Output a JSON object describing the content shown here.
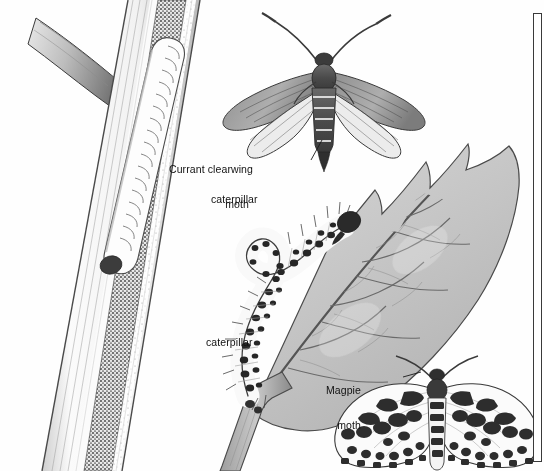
{
  "plate": {
    "title": "Currant pests illustration plate",
    "background_color": "#fefefe",
    "ink_color": "#2b2b2b",
    "frame_color": "#3a3a3a",
    "width": 544,
    "height": 471
  },
  "labels": [
    {
      "id": "currant-clearwing-moth",
      "line1": "Currant clearwing",
      "line2": "moth",
      "x": 249,
      "y": 142,
      "align": "right"
    },
    {
      "id": "caterpillar-top",
      "text": "caterpillar",
      "x": 211,
      "y": 194
    },
    {
      "id": "caterpillar-bottom",
      "text": "caterpillar",
      "x": 206,
      "y": 337
    },
    {
      "id": "magpie-moth",
      "line1": "Magpie",
      "line2": "moth",
      "x": 361,
      "y": 363,
      "align": "right"
    }
  ],
  "figures": [
    {
      "id": "stem-section",
      "name": "cut-open currant stem with boring caterpillar",
      "caption_ref": "caterpillar-top"
    },
    {
      "id": "clearwing-moth",
      "name": "currant clearwing moth, wings spread",
      "caption_ref": "currant-clearwing-moth"
    },
    {
      "id": "magpie-caterpillar",
      "name": "magpie moth caterpillar looping on leaf",
      "caption_ref": "caterpillar-bottom"
    },
    {
      "id": "currant-leaf",
      "name": "lobed currant leaf with veins"
    },
    {
      "id": "magpie-moth-figure",
      "name": "magpie moth with spotted wings",
      "caption_ref": "magpie-moth"
    }
  ],
  "frame": {
    "id": "right-edge-frame",
    "visible": true
  }
}
